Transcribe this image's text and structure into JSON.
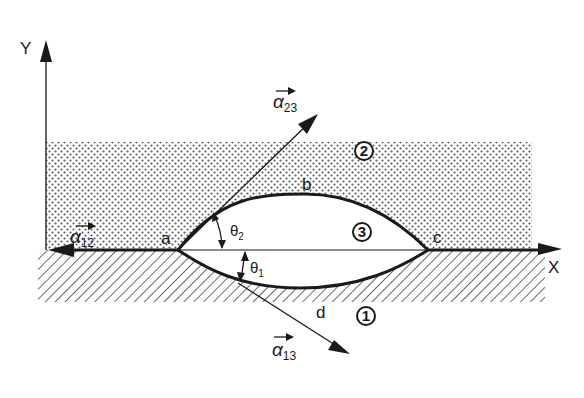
{
  "diagram": {
    "type": "three-phase contact lens (interfacial tension balance)",
    "axes": {
      "x_label": "X",
      "y_label": "Y"
    },
    "points": {
      "a": "a",
      "b": "b",
      "c": "c",
      "d": "d"
    },
    "phases": [
      {
        "id": "1",
        "label": "1",
        "fill": "hatched",
        "region": "lower medium"
      },
      {
        "id": "2",
        "label": "2",
        "fill": "dotted",
        "region": "upper medium"
      },
      {
        "id": "3",
        "label": "3",
        "fill": "blank",
        "region": "lens"
      }
    ],
    "vectors": [
      {
        "id": "alpha12",
        "symbol": "α",
        "subscript": "12",
        "direction": "left along X axis from a"
      },
      {
        "id": "alpha23",
        "symbol": "α",
        "subscript": "23",
        "direction": "up-right, tangent to arc a-b"
      },
      {
        "id": "alpha13",
        "symbol": "α",
        "subscript": "13",
        "direction": "down-right, tangent to arc a-d"
      }
    ],
    "angles": [
      {
        "id": "theta2",
        "symbol": "θ",
        "subscript": "2",
        "between": "X axis and upper arc at a"
      },
      {
        "id": "theta1",
        "symbol": "θ",
        "subscript": "1",
        "between": "X axis and lower arc at a"
      }
    ],
    "colors": {
      "ink": "#1a1a1a",
      "background": "#ffffff",
      "dots": "#555555",
      "hatch": "#444444"
    }
  }
}
